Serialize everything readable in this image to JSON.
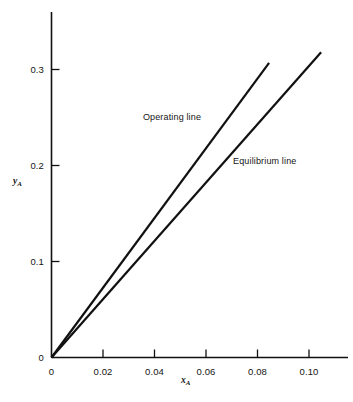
{
  "chart_data": {
    "type": "line",
    "title": "",
    "subtitle": "",
    "xlabel": "x_A",
    "ylabel": "y_A",
    "xlim": [
      0,
      0.118
    ],
    "ylim": [
      0,
      0.36
    ],
    "grid": false,
    "legend_position": "inline-annotations",
    "x_ticks": [
      {
        "value": 0,
        "label": "0"
      },
      {
        "value": 0.02,
        "label": "0.02"
      },
      {
        "value": 0.04,
        "label": "0.04"
      },
      {
        "value": 0.06,
        "label": "0.06"
      },
      {
        "value": 0.08,
        "label": "0.08"
      },
      {
        "value": 0.1,
        "label": "0.10"
      }
    ],
    "y_ticks": [
      {
        "value": 0,
        "label": "0"
      },
      {
        "value": 0.1,
        "label": "0.1"
      },
      {
        "value": 0.2,
        "label": "0.2"
      },
      {
        "value": 0.3,
        "label": "0.3"
      }
    ],
    "series": [
      {
        "name": "Operating line",
        "color": "#111111",
        "x": [
          0,
          0.0845
        ],
        "y": [
          0,
          0.307
        ],
        "slope": 3.633
      },
      {
        "name": "Equilibrium line",
        "color": "#111111",
        "x": [
          0,
          0.1047
        ],
        "y": [
          0,
          0.318
        ],
        "slope": 3.037
      }
    ],
    "annotations": [
      {
        "text": "Operating line",
        "x": 0.0355,
        "y": 0.249
      },
      {
        "text": "Equilibrium line",
        "x": 0.0705,
        "y": 0.204
      }
    ]
  },
  "axis": {
    "y_label_main": "y",
    "y_label_sub": "A",
    "x_label_main": "x",
    "x_label_sub": "A"
  }
}
